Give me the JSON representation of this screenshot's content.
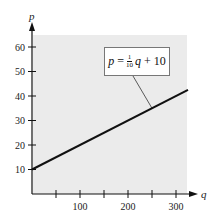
{
  "chart_data": {
    "type": "line",
    "title": "",
    "xlabel": "q",
    "ylabel": "p",
    "x_ticks": [
      50,
      100,
      150,
      200,
      250,
      300
    ],
    "x_tick_labels": [
      "100",
      "200",
      "300"
    ],
    "y_ticks": [
      10,
      20,
      30,
      40,
      50,
      60
    ],
    "y_tick_labels": [
      "10",
      "20",
      "30",
      "40",
      "50",
      "60"
    ],
    "xlim": [
      0,
      325
    ],
    "ylim": [
      0,
      65
    ],
    "grid": false,
    "background": "#ebebeb",
    "series": [
      {
        "name": "p = 1/10 q + 10",
        "x": [
          0,
          325
        ],
        "y": [
          10,
          42.5
        ],
        "color": "#111111"
      }
    ],
    "annotation": {
      "text_lhs": "p",
      "text_eq": "=",
      "frac_num": "1",
      "frac_den": "10",
      "text_var": "q",
      "text_rest": "+ 10",
      "points_to": {
        "q": 250,
        "p": 35
      }
    }
  }
}
